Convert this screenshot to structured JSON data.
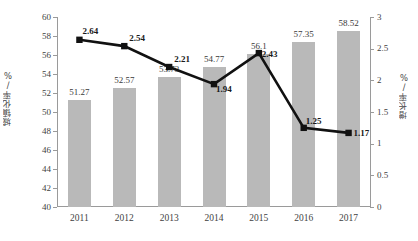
{
  "chart_data": {
    "type": "bar",
    "title": "",
    "subtitle": "",
    "xlabel": "",
    "ylabel": "城镇化率/%",
    "y2label": "增长率/%",
    "categories": [
      "2011",
      "2012",
      "2013",
      "2014",
      "2015",
      "2016",
      "2017"
    ],
    "ylim": [
      40,
      60
    ],
    "y2lim": [
      0,
      3
    ],
    "y_ticks": [
      "40",
      "42",
      "44",
      "46",
      "48",
      "50",
      "52",
      "54",
      "56",
      "58",
      "60"
    ],
    "y2_ticks": [
      "0",
      "0.5",
      "1",
      "1.5",
      "2",
      "2.5",
      "3"
    ],
    "grid": false,
    "legend_position": "none",
    "series": [
      {
        "name": "城镇化率",
        "type": "bar",
        "axis": "left",
        "color": "#b9b9b9",
        "values": [
          51.27,
          52.57,
          53.73,
          54.77,
          56.1,
          57.35,
          58.52
        ],
        "labels": [
          "51.27",
          "52.57",
          "53.73",
          "54.77",
          "56.1",
          "57.35",
          "58.52"
        ]
      },
      {
        "name": "增长率",
        "type": "line",
        "axis": "right",
        "color": "#111111",
        "marker": "square",
        "values": [
          2.64,
          2.54,
          2.21,
          1.94,
          2.43,
          1.25,
          1.17
        ],
        "labels": [
          "2.64",
          "2.54",
          "2.21",
          "1.94",
          "2.43",
          "1.25",
          "1.17"
        ]
      }
    ]
  },
  "caption": {
    "text": ""
  }
}
